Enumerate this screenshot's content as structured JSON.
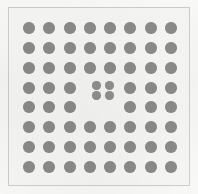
{
  "figure": {
    "kind": "dot-lattice-diagram",
    "title": "",
    "caption": "",
    "width_px": 198,
    "height_px": 194,
    "background_color": "#f7f7f5",
    "frame_color": "#cfcfc9",
    "atom_color": "#8b8b8b",
    "defect_color": "#909090"
  },
  "chart_data": {
    "type": "scatter",
    "title": "",
    "subtitle": "",
    "xlabel": "",
    "ylabel": "",
    "grid": false,
    "legend_position": "none",
    "xlim": [
      0,
      9
    ],
    "ylim": [
      0,
      9
    ],
    "xticks": [],
    "yticks": [],
    "annotations": [],
    "series": [
      {
        "name": "lattice-atoms",
        "marker": "circle",
        "color": "#8b8b8b",
        "marker_size_px": 12,
        "count": 60,
        "points": [
          {
            "row": 1,
            "col": 1,
            "x": 1,
            "y": 8
          },
          {
            "row": 1,
            "col": 2,
            "x": 2,
            "y": 8
          },
          {
            "row": 1,
            "col": 3,
            "x": 3,
            "y": 8
          },
          {
            "row": 1,
            "col": 4,
            "x": 4,
            "y": 8
          },
          {
            "row": 1,
            "col": 5,
            "x": 5,
            "y": 8
          },
          {
            "row": 1,
            "col": 6,
            "x": 6,
            "y": 8
          },
          {
            "row": 1,
            "col": 7,
            "x": 7,
            "y": 8
          },
          {
            "row": 1,
            "col": 8,
            "x": 8,
            "y": 8
          },
          {
            "row": 2,
            "col": 1,
            "x": 1,
            "y": 7
          },
          {
            "row": 2,
            "col": 2,
            "x": 2,
            "y": 7
          },
          {
            "row": 2,
            "col": 3,
            "x": 3,
            "y": 7
          },
          {
            "row": 2,
            "col": 4,
            "x": 4,
            "y": 7
          },
          {
            "row": 2,
            "col": 5,
            "x": 5,
            "y": 7
          },
          {
            "row": 2,
            "col": 6,
            "x": 6,
            "y": 7
          },
          {
            "row": 2,
            "col": 7,
            "x": 7,
            "y": 7
          },
          {
            "row": 2,
            "col": 8,
            "x": 8,
            "y": 7
          },
          {
            "row": 3,
            "col": 1,
            "x": 1,
            "y": 6
          },
          {
            "row": 3,
            "col": 2,
            "x": 2,
            "y": 6
          },
          {
            "row": 3,
            "col": 3,
            "x": 3,
            "y": 6
          },
          {
            "row": 3,
            "col": 4,
            "x": 4,
            "y": 6
          },
          {
            "row": 3,
            "col": 5,
            "x": 5,
            "y": 6
          },
          {
            "row": 3,
            "col": 6,
            "x": 6,
            "y": 6
          },
          {
            "row": 3,
            "col": 7,
            "x": 7,
            "y": 6
          },
          {
            "row": 3,
            "col": 8,
            "x": 8,
            "y": 6
          },
          {
            "row": 4,
            "col": 1,
            "x": 1,
            "y": 5
          },
          {
            "row": 4,
            "col": 2,
            "x": 2,
            "y": 5
          },
          {
            "row": 4,
            "col": 3,
            "x": 3,
            "y": 5
          },
          {
            "row": 4,
            "col": 6,
            "x": 6,
            "y": 5
          },
          {
            "row": 4,
            "col": 7,
            "x": 7,
            "y": 5
          },
          {
            "row": 4,
            "col": 8,
            "x": 8,
            "y": 5
          },
          {
            "row": 5,
            "col": 1,
            "x": 1,
            "y": 4
          },
          {
            "row": 5,
            "col": 2,
            "x": 2,
            "y": 4
          },
          {
            "row": 5,
            "col": 3,
            "x": 3,
            "y": 4
          },
          {
            "row": 5,
            "col": 6,
            "x": 6,
            "y": 4
          },
          {
            "row": 5,
            "col": 7,
            "x": 7,
            "y": 4
          },
          {
            "row": 5,
            "col": 8,
            "x": 8,
            "y": 4
          },
          {
            "row": 6,
            "col": 1,
            "x": 1,
            "y": 3
          },
          {
            "row": 6,
            "col": 2,
            "x": 2,
            "y": 3
          },
          {
            "row": 6,
            "col": 3,
            "x": 3,
            "y": 3
          },
          {
            "row": 6,
            "col": 4,
            "x": 4,
            "y": 3
          },
          {
            "row": 6,
            "col": 5,
            "x": 5,
            "y": 3
          },
          {
            "row": 6,
            "col": 6,
            "x": 6,
            "y": 3
          },
          {
            "row": 6,
            "col": 7,
            "x": 7,
            "y": 3
          },
          {
            "row": 6,
            "col": 8,
            "x": 8,
            "y": 3
          },
          {
            "row": 7,
            "col": 1,
            "x": 1,
            "y": 2
          },
          {
            "row": 7,
            "col": 2,
            "x": 2,
            "y": 2
          },
          {
            "row": 7,
            "col": 3,
            "x": 3,
            "y": 2
          },
          {
            "row": 7,
            "col": 4,
            "x": 4,
            "y": 2
          },
          {
            "row": 7,
            "col": 5,
            "x": 5,
            "y": 2
          },
          {
            "row": 7,
            "col": 6,
            "x": 6,
            "y": 2
          },
          {
            "row": 7,
            "col": 7,
            "x": 7,
            "y": 2
          },
          {
            "row": 7,
            "col": 8,
            "x": 8,
            "y": 2
          },
          {
            "row": 8,
            "col": 1,
            "x": 1,
            "y": 1
          },
          {
            "row": 8,
            "col": 2,
            "x": 2,
            "y": 1
          },
          {
            "row": 8,
            "col": 3,
            "x": 3,
            "y": 1
          },
          {
            "row": 8,
            "col": 4,
            "x": 4,
            "y": 1
          },
          {
            "row": 8,
            "col": 5,
            "x": 5,
            "y": 1
          },
          {
            "row": 8,
            "col": 6,
            "x": 6,
            "y": 1
          },
          {
            "row": 8,
            "col": 7,
            "x": 7,
            "y": 1
          },
          {
            "row": 8,
            "col": 8,
            "x": 8,
            "y": 1
          }
        ]
      },
      {
        "name": "defect-cluster",
        "marker": "circle",
        "color": "#909090",
        "marker_size_px": 9,
        "count": 4,
        "points": [
          {
            "x": 4.35,
            "y": 5.12
          },
          {
            "x": 4.95,
            "y": 5.12
          },
          {
            "x": 4.35,
            "y": 4.58
          },
          {
            "x": 4.95,
            "y": 4.58
          }
        ]
      }
    ]
  },
  "geometry": {
    "lattice": {
      "rows": 8,
      "cols": 8,
      "origin_x_px": 18,
      "origin_y_px": 16,
      "step_x_px": 21.2,
      "step_y_px": 20.8,
      "dot_diameter_px": 12
    },
    "defect": {
      "dot_diameter_px": 9,
      "positions_px": [
        {
          "cx": 85,
          "cy": 82
        },
        {
          "cx": 98,
          "cy": 82
        },
        {
          "cx": 85,
          "cy": 94
        },
        {
          "cx": 98,
          "cy": 94
        }
      ]
    }
  }
}
